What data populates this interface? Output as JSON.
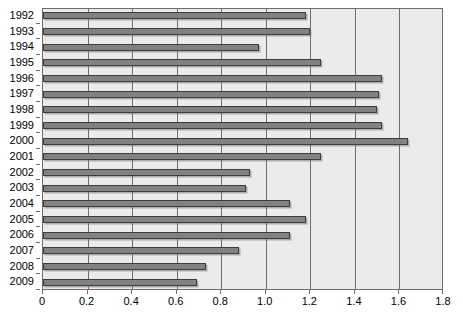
{
  "chart_data": {
    "type": "bar",
    "orientation": "horizontal",
    "title": "",
    "subtitle": "",
    "xlabel": "",
    "ylabel": "",
    "xlim": [
      0,
      1.8
    ],
    "xticks": [
      "0",
      "0.2",
      "0.4",
      "0.6",
      "0.8",
      "1.0",
      "1.2",
      "1.4",
      "1.6",
      "1.8"
    ],
    "xtick_values": [
      0,
      0.2,
      0.4,
      0.6,
      0.8,
      1.0,
      1.2,
      1.4,
      1.6,
      1.8
    ],
    "grid": "vertical",
    "legend": "none",
    "categories": [
      "1992",
      "1993",
      "1994",
      "1995",
      "1996",
      "1997",
      "1998",
      "1999",
      "2000",
      "2001",
      "2002",
      "2003",
      "2004",
      "2005",
      "2006",
      "2007",
      "2008",
      "2009"
    ],
    "values": [
      1.18,
      1.2,
      0.97,
      1.25,
      1.52,
      1.51,
      1.5,
      1.52,
      1.64,
      1.25,
      0.93,
      0.91,
      1.11,
      1.18,
      1.11,
      0.88,
      0.73,
      0.69
    ],
    "series": [
      {
        "name": "",
        "values": [
          1.18,
          1.2,
          0.97,
          1.25,
          1.52,
          1.51,
          1.5,
          1.52,
          1.64,
          1.25,
          0.93,
          0.91,
          1.11,
          1.18,
          1.11,
          0.88,
          0.73,
          0.69
        ]
      }
    ],
    "colors": {
      "bar_fill": "#828282",
      "bar_border": "#3d3d3d",
      "plot_background": "#ebebeb",
      "gridline": "#6e6e6e",
      "axis": "#6e6e6e",
      "text": "#000000",
      "page_background": "#ffffff"
    }
  }
}
